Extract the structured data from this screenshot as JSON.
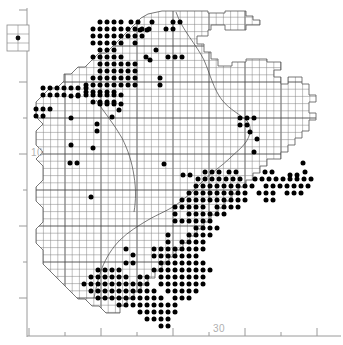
{
  "figure": {
    "type": "distribution-dot-map",
    "width": 343,
    "height": 345,
    "background_color": "#ffffff",
    "ink_color": "#000000",
    "grid_color": "#808080",
    "outline_color": "#555555",
    "axis_color": "#9a9a9a",
    "axis_label_color": "#b4b4b4"
  },
  "axes": {
    "x_axis": {
      "label_values": [
        "30"
      ],
      "label_positions_px": [
        219
      ],
      "axis_y_px": 336,
      "minor_tick_positions_px": [
        29,
        65,
        101,
        137,
        173,
        209,
        245,
        281,
        317
      ],
      "major_tick_positions_px": [
        29,
        101,
        173,
        245,
        317
      ],
      "minor_tick_length_px": 4,
      "major_tick_length_px": 8
    },
    "y_axis": {
      "label_values": [
        "10"
      ],
      "label_positions_px": [
        152
      ],
      "axis_x_px": 27,
      "minor_tick_positions_px": [
        10,
        46,
        82,
        118,
        154,
        190,
        226,
        262,
        298
      ],
      "major_tick_positions_px": [
        10,
        82,
        154,
        226,
        298
      ],
      "minor_tick_length_px": 4,
      "major_tick_length_px": 8
    }
  },
  "legend_box": {
    "name": "symbol-key-box",
    "x_px": 7,
    "y_px": 25,
    "width_px": 22,
    "height_px": 26,
    "symbol": "filled-circle"
  },
  "grid": {
    "cell_size_px": 7.2,
    "origin_x_px": 29,
    "origin_y_px": 10,
    "heavy_line_every_n_cells": 5
  },
  "chart_data": {
    "type": "scatter",
    "title": "",
    "xlabel": "",
    "ylabel": "",
    "grid": true,
    "legend_position": "top-left",
    "region_outline": "187,11 208,11 208,13 225,13 225,11 246,11 246,16 253,16 253,20 260,20 260,25 246,25 246,30 225,30 225,25 211,25 211,30 208,30 208,36 197,36 197,44 204,44 204,52 211,52 211,59 218,59 218,66 232,66 232,62 246,62 246,59 267,59 267,62 281,62 281,70 274,70 274,77 281,77 281,84 288,84 288,77 302,77 302,84 309,84 309,95 316,95 316,102 309,102 309,113 316,113 316,120 309,120 309,131 302,131 302,138 295,138 295,145 288,145 288,152 281,152 281,159 267,159 267,166 260,166 260,173 253,173 253,180 246,180 246,187 239,187 239,194 232,194 232,201 225,201 225,208 218,208 218,215 211,215 211,222 204,222 204,229 197,229 197,236 190,236 190,243 183,243 183,250 176,250 176,257 169,257 169,264 162,264 162,271 155,271 155,278 148,278 148,285 141,285 141,292 134,292 134,299 127,299 127,306 120,306 120,313 113,313 106,313 99,306 92,306 85,299 78,299 71,292 64,285 57,278 50,271 43,264 43,250 36,243 36,229 43,222 43,208 36,201 36,187 43,180 43,166 36,159 43,152 36,145 36,131 43,124 36,117 36,102 43,95 50,88 57,88 64,81 64,74 71,74 78,67 85,67 92,60 99,53 106,53 113,46 120,39 127,32 134,25 141,18 148,14 162,11 175,11",
    "dots_px": [
      [
        100,
        22
      ],
      [
        107,
        22
      ],
      [
        114,
        22
      ],
      [
        121,
        22
      ],
      [
        131,
        22
      ],
      [
        138,
        22
      ],
      [
        152,
        22
      ],
      [
        173,
        22
      ],
      [
        180,
        22
      ],
      [
        93,
        29
      ],
      [
        100,
        29
      ],
      [
        107,
        29
      ],
      [
        114,
        29
      ],
      [
        121,
        29
      ],
      [
        128,
        29
      ],
      [
        135,
        29
      ],
      [
        142,
        29
      ],
      [
        149,
        29
      ],
      [
        166,
        29
      ],
      [
        173,
        29
      ],
      [
        93,
        36
      ],
      [
        100,
        36
      ],
      [
        107,
        36
      ],
      [
        114,
        36
      ],
      [
        121,
        36
      ],
      [
        128,
        36
      ],
      [
        135,
        36
      ],
      [
        142,
        36
      ],
      [
        93,
        43
      ],
      [
        100,
        43
      ],
      [
        107,
        43
      ],
      [
        114,
        43
      ],
      [
        121,
        43
      ],
      [
        135,
        43
      ],
      [
        100,
        50
      ],
      [
        107,
        50
      ],
      [
        114,
        50
      ],
      [
        156,
        50
      ],
      [
        93,
        57
      ],
      [
        100,
        57
      ],
      [
        107,
        57
      ],
      [
        114,
        57
      ],
      [
        121,
        57
      ],
      [
        146,
        57
      ],
      [
        100,
        64
      ],
      [
        107,
        64
      ],
      [
        114,
        64
      ],
      [
        121,
        64
      ],
      [
        128,
        64
      ],
      [
        135,
        64
      ],
      [
        100,
        71
      ],
      [
        107,
        71
      ],
      [
        114,
        71
      ],
      [
        121,
        71
      ],
      [
        128,
        71
      ],
      [
        135,
        71
      ],
      [
        93,
        78
      ],
      [
        100,
        78
      ],
      [
        107,
        78
      ],
      [
        114,
        78
      ],
      [
        121,
        78
      ],
      [
        128,
        78
      ],
      [
        135,
        78
      ],
      [
        86,
        85
      ],
      [
        93,
        85
      ],
      [
        100,
        85
      ],
      [
        107,
        85
      ],
      [
        114,
        85
      ],
      [
        121,
        85
      ],
      [
        128,
        85
      ],
      [
        135,
        85
      ],
      [
        86,
        92
      ],
      [
        93,
        92
      ],
      [
        100,
        92
      ],
      [
        107,
        92
      ],
      [
        114,
        92
      ],
      [
        43,
        88
      ],
      [
        50,
        88
      ],
      [
        57,
        88
      ],
      [
        64,
        88
      ],
      [
        71,
        88
      ],
      [
        78,
        88
      ],
      [
        86,
        88
      ],
      [
        43,
        95
      ],
      [
        50,
        95
      ],
      [
        57,
        95
      ],
      [
        64,
        95
      ],
      [
        78,
        95
      ],
      [
        86,
        95
      ],
      [
        93,
        95
      ],
      [
        100,
        95
      ],
      [
        107,
        95
      ],
      [
        114,
        95
      ],
      [
        121,
        95
      ],
      [
        36,
        109
      ],
      [
        43,
        109
      ],
      [
        50,
        109
      ],
      [
        36,
        116
      ],
      [
        43,
        116
      ],
      [
        71,
        96
      ],
      [
        78,
        96
      ],
      [
        93,
        102
      ],
      [
        100,
        102
      ],
      [
        107,
        102
      ],
      [
        114,
        102
      ],
      [
        100,
        104
      ],
      [
        107,
        104
      ],
      [
        114,
        104
      ],
      [
        121,
        104
      ],
      [
        140,
        30
      ],
      [
        147,
        30
      ],
      [
        150,
        60
      ],
      [
        168,
        57
      ],
      [
        175,
        57
      ],
      [
        182,
        57
      ],
      [
        160,
        78
      ],
      [
        160,
        85
      ],
      [
        71,
        118
      ],
      [
        97,
        124
      ],
      [
        97,
        131
      ],
      [
        71,
        145
      ],
      [
        93,
        148
      ],
      [
        240,
        118
      ],
      [
        247,
        118
      ],
      [
        240,
        125
      ],
      [
        247,
        125
      ],
      [
        254,
        118
      ],
      [
        250,
        132
      ],
      [
        257,
        139
      ],
      [
        254,
        152
      ],
      [
        303,
        163
      ],
      [
        164,
        164
      ],
      [
        183,
        175
      ],
      [
        190,
        175
      ],
      [
        205,
        172
      ],
      [
        212,
        172
      ],
      [
        219,
        172
      ],
      [
        229,
        172
      ],
      [
        236,
        172
      ],
      [
        265,
        172
      ],
      [
        272,
        172
      ],
      [
        290,
        175
      ],
      [
        297,
        175
      ],
      [
        305,
        172
      ],
      [
        198,
        179
      ],
      [
        205,
        179
      ],
      [
        212,
        179
      ],
      [
        219,
        179
      ],
      [
        226,
        179
      ],
      [
        233,
        179
      ],
      [
        240,
        179
      ],
      [
        255,
        179
      ],
      [
        262,
        179
      ],
      [
        269,
        179
      ],
      [
        276,
        179
      ],
      [
        283,
        179
      ],
      [
        290,
        179
      ],
      [
        297,
        179
      ],
      [
        304,
        179
      ],
      [
        311,
        179
      ],
      [
        196,
        186
      ],
      [
        203,
        186
      ],
      [
        210,
        186
      ],
      [
        217,
        186
      ],
      [
        224,
        186
      ],
      [
        231,
        186
      ],
      [
        238,
        186
      ],
      [
        245,
        186
      ],
      [
        252,
        186
      ],
      [
        266,
        186
      ],
      [
        273,
        186
      ],
      [
        280,
        186
      ],
      [
        287,
        186
      ],
      [
        294,
        186
      ],
      [
        301,
        186
      ],
      [
        308,
        186
      ],
      [
        189,
        193
      ],
      [
        196,
        193
      ],
      [
        203,
        193
      ],
      [
        210,
        193
      ],
      [
        217,
        193
      ],
      [
        224,
        193
      ],
      [
        231,
        193
      ],
      [
        238,
        193
      ],
      [
        245,
        193
      ],
      [
        259,
        193
      ],
      [
        266,
        193
      ],
      [
        273,
        193
      ],
      [
        287,
        193
      ],
      [
        294,
        193
      ],
      [
        301,
        193
      ],
      [
        182,
        200
      ],
      [
        189,
        200
      ],
      [
        196,
        200
      ],
      [
        203,
        200
      ],
      [
        210,
        200
      ],
      [
        217,
        200
      ],
      [
        224,
        200
      ],
      [
        231,
        200
      ],
      [
        238,
        200
      ],
      [
        245,
        200
      ],
      [
        266,
        200
      ],
      [
        273,
        200
      ],
      [
        175,
        207
      ],
      [
        182,
        207
      ],
      [
        189,
        207
      ],
      [
        196,
        207
      ],
      [
        203,
        207
      ],
      [
        217,
        207
      ],
      [
        224,
        207
      ],
      [
        231,
        207
      ],
      [
        238,
        207
      ],
      [
        189,
        214
      ],
      [
        196,
        214
      ],
      [
        203,
        214
      ],
      [
        210,
        214
      ],
      [
        217,
        214
      ],
      [
        224,
        214
      ],
      [
        182,
        221
      ],
      [
        189,
        221
      ],
      [
        196,
        221
      ],
      [
        203,
        221
      ],
      [
        210,
        221
      ],
      [
        175,
        214
      ],
      [
        175,
        221
      ],
      [
        196,
        228
      ],
      [
        203,
        228
      ],
      [
        210,
        228
      ],
      [
        217,
        228
      ],
      [
        189,
        235
      ],
      [
        196,
        235
      ],
      [
        203,
        235
      ],
      [
        210,
        235
      ],
      [
        182,
        242
      ],
      [
        189,
        242
      ],
      [
        196,
        242
      ],
      [
        203,
        242
      ],
      [
        168,
        235
      ],
      [
        168,
        242
      ],
      [
        175,
        249
      ],
      [
        182,
        249
      ],
      [
        189,
        249
      ],
      [
        196,
        249
      ],
      [
        203,
        249
      ],
      [
        161,
        249
      ],
      [
        168,
        249
      ],
      [
        175,
        256
      ],
      [
        182,
        256
      ],
      [
        189,
        256
      ],
      [
        196,
        256
      ],
      [
        161,
        256
      ],
      [
        168,
        256
      ],
      [
        154,
        249
      ],
      [
        154,
        256
      ],
      [
        175,
        263
      ],
      [
        182,
        263
      ],
      [
        189,
        263
      ],
      [
        196,
        263
      ],
      [
        203,
        263
      ],
      [
        168,
        263
      ],
      [
        161,
        263
      ],
      [
        175,
        270
      ],
      [
        182,
        270
      ],
      [
        189,
        270
      ],
      [
        196,
        270
      ],
      [
        203,
        270
      ],
      [
        210,
        270
      ],
      [
        154,
        270
      ],
      [
        161,
        270
      ],
      [
        168,
        270
      ],
      [
        161,
        277
      ],
      [
        168,
        277
      ],
      [
        175,
        277
      ],
      [
        182,
        277
      ],
      [
        189,
        277
      ],
      [
        196,
        277
      ],
      [
        203,
        277
      ],
      [
        140,
        277
      ],
      [
        147,
        277
      ],
      [
        126,
        263
      ],
      [
        133,
        263
      ],
      [
        112,
        270
      ],
      [
        119,
        270
      ],
      [
        98,
        270
      ],
      [
        105,
        270
      ],
      [
        91,
        277
      ],
      [
        98,
        277
      ],
      [
        105,
        277
      ],
      [
        112,
        277
      ],
      [
        119,
        277
      ],
      [
        126,
        277
      ],
      [
        84,
        284
      ],
      [
        91,
        284
      ],
      [
        98,
        284
      ],
      [
        105,
        284
      ],
      [
        112,
        284
      ],
      [
        119,
        284
      ],
      [
        126,
        284
      ],
      [
        133,
        284
      ],
      [
        140,
        284
      ],
      [
        147,
        284
      ],
      [
        161,
        284
      ],
      [
        168,
        284
      ],
      [
        175,
        284
      ],
      [
        182,
        284
      ],
      [
        189,
        284
      ],
      [
        196,
        284
      ],
      [
        203,
        284
      ],
      [
        91,
        291
      ],
      [
        98,
        291
      ],
      [
        105,
        291
      ],
      [
        112,
        291
      ],
      [
        119,
        291
      ],
      [
        126,
        291
      ],
      [
        133,
        291
      ],
      [
        140,
        291
      ],
      [
        147,
        291
      ],
      [
        154,
        291
      ],
      [
        168,
        291
      ],
      [
        175,
        291
      ],
      [
        182,
        291
      ],
      [
        189,
        291
      ],
      [
        196,
        291
      ],
      [
        98,
        298
      ],
      [
        105,
        298
      ],
      [
        112,
        298
      ],
      [
        119,
        298
      ],
      [
        126,
        298
      ],
      [
        133,
        298
      ],
      [
        140,
        298
      ],
      [
        147,
        298
      ],
      [
        154,
        298
      ],
      [
        161,
        298
      ],
      [
        175,
        298
      ],
      [
        182,
        298
      ],
      [
        189,
        298
      ],
      [
        119,
        305
      ],
      [
        126,
        305
      ],
      [
        133,
        305
      ],
      [
        140,
        305
      ],
      [
        147,
        305
      ],
      [
        154,
        305
      ],
      [
        161,
        305
      ],
      [
        168,
        305
      ],
      [
        175,
        305
      ],
      [
        140,
        312
      ],
      [
        147,
        312
      ],
      [
        154,
        312
      ],
      [
        161,
        312
      ],
      [
        168,
        312
      ],
      [
        175,
        312
      ],
      [
        147,
        319
      ],
      [
        154,
        319
      ],
      [
        161,
        319
      ],
      [
        168,
        319
      ],
      [
        161,
        326
      ],
      [
        168,
        326
      ],
      [
        133,
        255
      ],
      [
        126,
        249
      ],
      [
        91,
        197
      ],
      [
        77,
        163
      ],
      [
        70,
        163
      ],
      [
        112,
        117
      ],
      [
        119,
        110
      ]
    ]
  }
}
